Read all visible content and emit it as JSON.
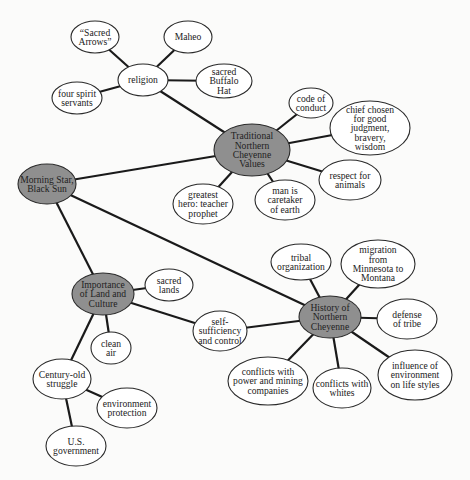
{
  "diagram": {
    "type": "concept-map",
    "colors": {
      "hub_fill": "#8f8f8f",
      "node_fill": "#ffffff",
      "line": "#1a1a1a",
      "background": "#fbfbfa"
    },
    "nodes": [
      {
        "id": "morning_star",
        "kind": "hub",
        "cx": 47,
        "cy": 184,
        "rx": 29,
        "ry": 20,
        "lines": [
          "Morning Star,",
          "Black Sun"
        ]
      },
      {
        "id": "traditional_values",
        "kind": "hub",
        "cx": 252,
        "cy": 150,
        "rx": 38,
        "ry": 26,
        "lines": [
          "Traditional",
          "Northern",
          "Cheyenne",
          "Values"
        ]
      },
      {
        "id": "importance_land",
        "kind": "hub",
        "cx": 103,
        "cy": 294,
        "rx": 31,
        "ry": 21,
        "lines": [
          "Importance",
          "of Land and",
          "Culture"
        ]
      },
      {
        "id": "history",
        "kind": "hub",
        "cx": 330,
        "cy": 317,
        "rx": 31,
        "ry": 21,
        "lines": [
          "History of",
          "Northern",
          "Cheyenne"
        ]
      },
      {
        "id": "religion",
        "kind": "plain",
        "cx": 143,
        "cy": 80,
        "rx": 25,
        "ry": 16,
        "lines": [
          "religion"
        ]
      },
      {
        "id": "sacred_arrows",
        "kind": "plain",
        "cx": 95,
        "cy": 37,
        "rx": 24,
        "ry": 16,
        "lines": [
          "“Sacred",
          "Arrows”"
        ]
      },
      {
        "id": "maheo",
        "kind": "plain",
        "cx": 188,
        "cy": 37,
        "rx": 24,
        "ry": 16,
        "lines": [
          "Maheo"
        ]
      },
      {
        "id": "buffalo_hat",
        "kind": "plain",
        "cx": 224,
        "cy": 81,
        "rx": 28,
        "ry": 17,
        "lines": [
          "sacred",
          "Buffalo",
          "Hat"
        ]
      },
      {
        "id": "spirit_servants",
        "kind": "plain",
        "cx": 77,
        "cy": 98,
        "rx": 25,
        "ry": 16,
        "lines": [
          "four spirit",
          "servants"
        ]
      },
      {
        "id": "code_conduct",
        "kind": "plain",
        "cx": 311,
        "cy": 103,
        "rx": 22,
        "ry": 15,
        "lines": [
          "code of",
          "conduct"
        ]
      },
      {
        "id": "chief_chosen",
        "kind": "plain",
        "cx": 370,
        "cy": 128,
        "rx": 40,
        "ry": 27,
        "lines": [
          "chief chosen",
          "for good",
          "judgment,",
          "bravery,",
          "wisdom"
        ]
      },
      {
        "id": "respect_animals",
        "kind": "plain",
        "cx": 350,
        "cy": 180,
        "rx": 31,
        "ry": 20,
        "lines": [
          "respect for",
          "animals"
        ]
      },
      {
        "id": "greatest_hero",
        "kind": "plain",
        "cx": 203,
        "cy": 204,
        "rx": 30,
        "ry": 20,
        "lines": [
          "greatest",
          "hero: teacher",
          "prophet"
        ]
      },
      {
        "id": "caretaker",
        "kind": "plain",
        "cx": 285,
        "cy": 200,
        "rx": 30,
        "ry": 20,
        "lines": [
          "man is",
          "caretaker",
          "of earth"
        ]
      },
      {
        "id": "sacred_lands",
        "kind": "plain",
        "cx": 169,
        "cy": 285,
        "rx": 24,
        "ry": 16,
        "lines": [
          "sacred",
          "lands"
        ]
      },
      {
        "id": "clean_air",
        "kind": "plain",
        "cx": 111,
        "cy": 348,
        "rx": 20,
        "ry": 16,
        "lines": [
          "clean",
          "air"
        ]
      },
      {
        "id": "self_sufficiency",
        "kind": "plain",
        "cx": 220,
        "cy": 331,
        "rx": 27,
        "ry": 20,
        "lines": [
          "self-",
          "sufficiency",
          "and control"
        ]
      },
      {
        "id": "tribal_org",
        "kind": "plain",
        "cx": 301,
        "cy": 262,
        "rx": 30,
        "ry": 18,
        "lines": [
          "tribal",
          "organization"
        ]
      },
      {
        "id": "migration",
        "kind": "plain",
        "cx": 378,
        "cy": 264,
        "rx": 37,
        "ry": 24,
        "lines": [
          "migration",
          "from",
          "Minnesota to",
          "Montana"
        ]
      },
      {
        "id": "defense",
        "kind": "plain",
        "cx": 407,
        "cy": 319,
        "rx": 30,
        "ry": 20,
        "lines": [
          "defense",
          "of tribe"
        ]
      },
      {
        "id": "influence_env",
        "kind": "plain",
        "cx": 415,
        "cy": 375,
        "rx": 37,
        "ry": 25,
        "lines": [
          "influence of",
          "environment",
          "on life styles"
        ]
      },
      {
        "id": "conflicts_whites",
        "kind": "plain",
        "cx": 342,
        "cy": 388,
        "rx": 29,
        "ry": 20,
        "lines": [
          "conflicts with",
          "whites"
        ]
      },
      {
        "id": "conflicts_power",
        "kind": "plain",
        "cx": 268,
        "cy": 381,
        "rx": 40,
        "ry": 24,
        "lines": [
          "conflicts with",
          "power and mining",
          "companies"
        ]
      },
      {
        "id": "century_struggle",
        "kind": "plain",
        "cx": 62,
        "cy": 379,
        "rx": 29,
        "ry": 20,
        "lines": [
          "Century-old",
          "struggle"
        ]
      },
      {
        "id": "env_protection",
        "kind": "plain",
        "cx": 127,
        "cy": 408,
        "rx": 30,
        "ry": 20,
        "lines": [
          "environment",
          "protection"
        ]
      },
      {
        "id": "us_government",
        "kind": "plain",
        "cx": 76,
        "cy": 446,
        "rx": 30,
        "ry": 20,
        "lines": [
          "U.S.",
          "government"
        ]
      }
    ],
    "edges": [
      [
        "religion",
        "sacred_arrows"
      ],
      [
        "religion",
        "maheo"
      ],
      [
        "religion",
        "buffalo_hat"
      ],
      [
        "religion",
        "spirit_servants"
      ],
      [
        "religion",
        "traditional_values"
      ],
      [
        "traditional_values",
        "code_conduct"
      ],
      [
        "traditional_values",
        "chief_chosen"
      ],
      [
        "traditional_values",
        "respect_animals"
      ],
      [
        "traditional_values",
        "caretaker"
      ],
      [
        "traditional_values",
        "greatest_hero"
      ],
      [
        "traditional_values",
        "morning_star"
      ],
      [
        "morning_star",
        "importance_land"
      ],
      [
        "morning_star",
        "history"
      ],
      [
        "importance_land",
        "sacred_lands"
      ],
      [
        "importance_land",
        "clean_air"
      ],
      [
        "importance_land",
        "self_sufficiency"
      ],
      [
        "importance_land",
        "century_struggle"
      ],
      [
        "self_sufficiency",
        "history"
      ],
      [
        "history",
        "tribal_org"
      ],
      [
        "history",
        "migration"
      ],
      [
        "history",
        "defense"
      ],
      [
        "history",
        "influence_env"
      ],
      [
        "history",
        "conflicts_whites"
      ],
      [
        "history",
        "conflicts_power"
      ],
      [
        "century_struggle",
        "env_protection"
      ],
      [
        "century_struggle",
        "us_government"
      ]
    ]
  }
}
